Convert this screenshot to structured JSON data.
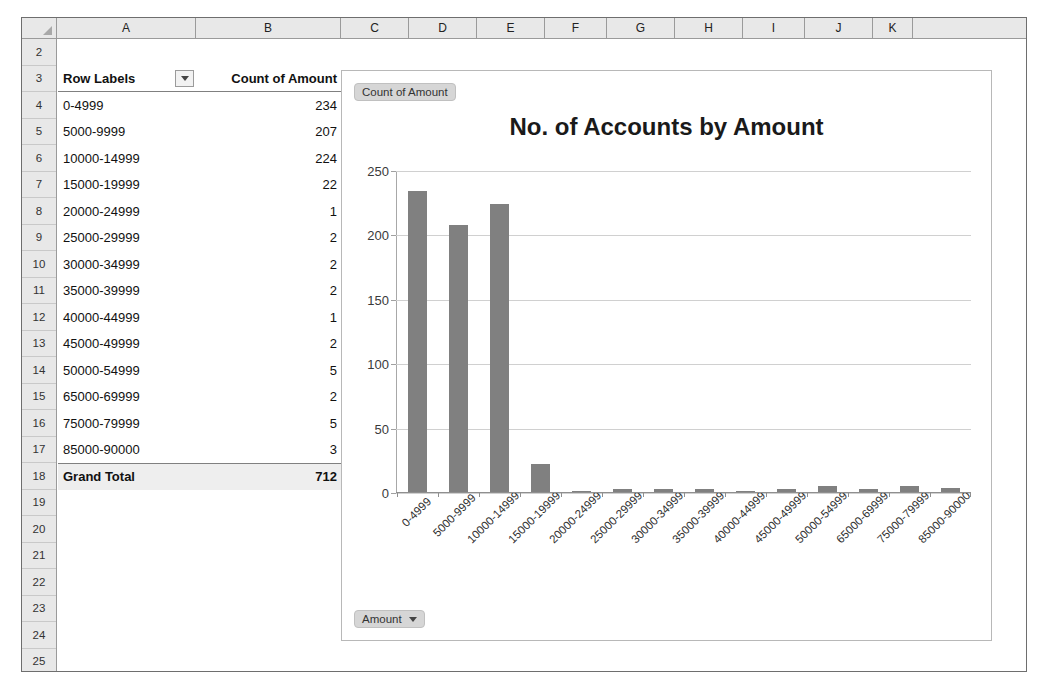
{
  "grid": {
    "columns": [
      "A",
      "B",
      "C",
      "D",
      "E",
      "F",
      "G",
      "H",
      "I",
      "J",
      "K"
    ],
    "row_numbers": [
      "2",
      "3",
      "4",
      "5",
      "6",
      "7",
      "8",
      "9",
      "10",
      "11",
      "12",
      "13",
      "14",
      "15",
      "16",
      "17",
      "18",
      "19",
      "20",
      "21",
      "22",
      "23",
      "24",
      "25"
    ],
    "select_all_name": "select-all-corner"
  },
  "pivot_table": {
    "header": {
      "row_labels": "Row Labels",
      "value_field": "Count of Amount",
      "filter_icon": "filter-dropdown-icon"
    },
    "rows": [
      {
        "label": "0-4999",
        "count": "234"
      },
      {
        "label": "5000-9999",
        "count": "207"
      },
      {
        "label": "10000-14999",
        "count": "224"
      },
      {
        "label": "15000-19999",
        "count": "22"
      },
      {
        "label": "20000-24999",
        "count": "1"
      },
      {
        "label": "25000-29999",
        "count": "2"
      },
      {
        "label": "30000-34999",
        "count": "2"
      },
      {
        "label": "35000-39999",
        "count": "2"
      },
      {
        "label": "40000-44999",
        "count": "1"
      },
      {
        "label": "45000-49999",
        "count": "2"
      },
      {
        "label": "50000-54999",
        "count": "5"
      },
      {
        "label": "65000-69999",
        "count": "2"
      },
      {
        "label": "75000-79999",
        "count": "5"
      },
      {
        "label": "85000-90000",
        "count": "3"
      }
    ],
    "total": {
      "label": "Grand Total",
      "count": "712"
    }
  },
  "chart": {
    "legend_field_button": "Count of Amount",
    "axis_field_button": "Amount",
    "dropdown_icon": "chevron-down-icon"
  },
  "chart_data": {
    "type": "bar",
    "title": "No. of Accounts by Amount",
    "xlabel": "",
    "ylabel": "",
    "ylim": [
      0,
      250
    ],
    "yticks": [
      0,
      50,
      100,
      150,
      200,
      250
    ],
    "ytick_labels": [
      "0",
      "50",
      "100",
      "150",
      "200",
      "250"
    ],
    "grid": true,
    "legend_position": "none",
    "series_name": "Count of Amount",
    "bar_color": "#808080",
    "categories": [
      "0-4999",
      "5000-9999",
      "10000-14999",
      "15000-19999",
      "20000-24999",
      "25000-29999",
      "30000-34999",
      "35000-39999",
      "40000-44999",
      "45000-49999",
      "50000-54999",
      "65000-69999",
      "75000-79999",
      "85000-90000"
    ],
    "values": [
      234,
      207,
      224,
      22,
      1,
      2,
      2,
      2,
      1,
      2,
      5,
      2,
      5,
      3
    ]
  }
}
